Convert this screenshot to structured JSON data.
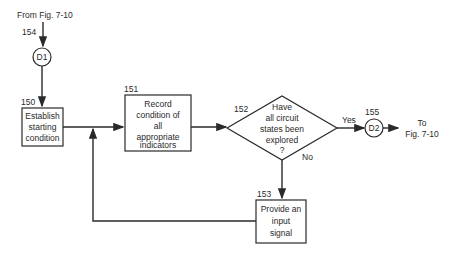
{
  "diagram": {
    "entry": {
      "label": "From Fig. 7-10",
      "ref": "154"
    },
    "connector_in": {
      "label": "D1",
      "ref": "154"
    },
    "step_150": {
      "ref": "150",
      "lines": [
        "Establish",
        "starting",
        "condition"
      ]
    },
    "step_151": {
      "ref": "151",
      "lines": [
        "Record",
        "condition of",
        "all",
        "appropriate",
        "indicators"
      ]
    },
    "decision_152": {
      "ref": "152",
      "lines": [
        "Have",
        "all circuit",
        "states been",
        "explored",
        "?"
      ],
      "yes_label": "Yes",
      "no_label": "No"
    },
    "step_153": {
      "ref": "153",
      "lines": [
        "Provide an",
        "input",
        "signal"
      ]
    },
    "connector_out": {
      "label": "D2",
      "ref": "155"
    },
    "exit": {
      "lines": [
        "To",
        "Fig. 7-10"
      ]
    }
  }
}
